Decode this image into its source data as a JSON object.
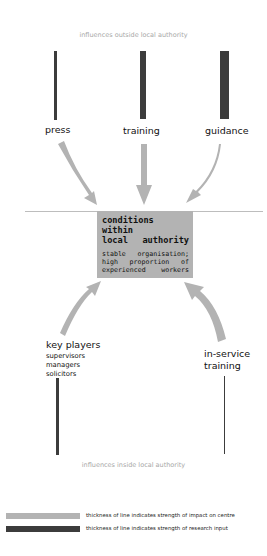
{
  "diagram": {
    "top_region_label": "influences outside local authority",
    "bottom_region_label": "influences inside local authority",
    "colors": {
      "impact_line": "#b3b3b3",
      "research_line": "#3c3c3c",
      "center_box": "#b3b3b3",
      "region_label": "#a8a8a8",
      "divider": "#bdbdbd"
    },
    "outside_influences": [
      {
        "id": "press",
        "label": "press",
        "research_bar_width": 3,
        "impact_arrow_width": 9
      },
      {
        "id": "training",
        "label": "training",
        "research_bar_width": 6,
        "impact_arrow_width": 7
      },
      {
        "id": "guidance",
        "label": "guidance",
        "research_bar_width": 8,
        "impact_arrow_width": 3
      }
    ],
    "center": {
      "title": "conditions within local authority",
      "title_line1": "conditions within",
      "title_line2": "local authority",
      "description_line1": "stable organisation;",
      "description_line2": "high proportion of",
      "description_line3": "experienced workers"
    },
    "inside_influences": [
      {
        "id": "key-players",
        "label": "key players",
        "sub_items": [
          "supervisors",
          "managers",
          "solicitors"
        ],
        "research_bar_width": 3,
        "impact_arrow_width": 6
      },
      {
        "id": "in-service-training",
        "label_line1": "in-service",
        "label_line2": "training",
        "research_bar_width": 1,
        "impact_arrow_width": 9
      }
    ],
    "legend": [
      {
        "swatch": "light",
        "text": "thickness of line indicates strength of impact on centre"
      },
      {
        "swatch": "dark",
        "text": "thickness of line indicates strength of research input"
      }
    ]
  }
}
